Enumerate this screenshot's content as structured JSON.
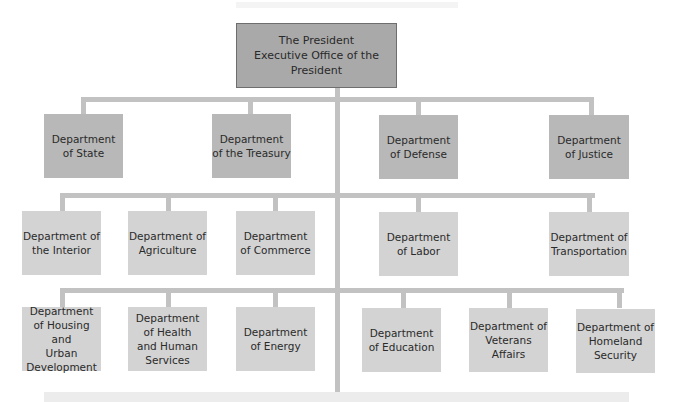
{
  "diagram": {
    "type": "org-chart",
    "root": {
      "label": "The President\nExecutive Office of the President"
    },
    "rows": [
      {
        "name": "row-1",
        "items": [
          {
            "label": "Department\nof State"
          },
          {
            "label": "Department\nof the Treasury"
          },
          {
            "label": "Department\nof Defense"
          },
          {
            "label": "Department\nof Justice"
          }
        ]
      },
      {
        "name": "row-2",
        "items": [
          {
            "label": "Department of\nthe Interior"
          },
          {
            "label": "Department of\nAgriculture"
          },
          {
            "label": "Department\nof Commerce"
          },
          {
            "label": "Department\nof Labor"
          },
          {
            "label": "Department of\nTransportation"
          }
        ]
      },
      {
        "name": "row-3",
        "items": [
          {
            "label": "Department\nof Housing and\nUrban\nDevelopment"
          },
          {
            "label": "Department\nof Health\nand Human\nServices"
          },
          {
            "label": "Department\nof Energy"
          },
          {
            "label": "Department\nof Education"
          },
          {
            "label": "Department of\nVeterans\nAffairs"
          },
          {
            "label": "Department of\nHomeland\nSecurity"
          }
        ]
      }
    ],
    "colors": {
      "president_fill": "#a9a9a9",
      "president_border": "#6e6e6e",
      "row1_fill": "#b8b8b8",
      "row23_fill": "#d3d3d3",
      "connector": "#c2c2c2",
      "text": "#2a2a2a"
    }
  }
}
